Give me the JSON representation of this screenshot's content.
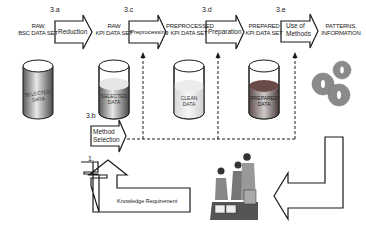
{
  "diagram": {
    "stages": [
      {
        "id": "raw-bsc",
        "label_line1": "RAW",
        "label_line2": "BSC DATA SET",
        "cylinder_text_line1": "SELECTED",
        "cylinder_text_line2": "DATA",
        "fill": "full-gray"
      },
      {
        "id": "raw-kpi",
        "label_line1": "RAW",
        "label_line2": "KPI DATA SET",
        "cylinder_text_line1": "SELECTED",
        "cylinder_text_line2": "DATA",
        "fill": "partial-gray"
      },
      {
        "id": "preprocessed-kpi",
        "label_line1": "PREPROCESSED",
        "label_line2": "KPI DATA SET",
        "cylinder_text_line1": "CLEAN",
        "cylinder_text_line2": "DATA",
        "fill": "light"
      },
      {
        "id": "prepared-kpi",
        "label_line1": "PREPARED",
        "label_line2": "KPI DATA SET",
        "cylinder_text_line1": "PREPARED",
        "cylinder_text_line2": "DATA",
        "fill": "dark-top"
      },
      {
        "id": "patterns",
        "label_line1": "PATTERNS,",
        "label_line2": "INFORMATION",
        "icon": "gears-icon"
      }
    ],
    "process_arrows": [
      {
        "step": "3.a",
        "label_line1": "Reduction",
        "label_line2": ""
      },
      {
        "step": "3.c",
        "label_line1": "Preprocessing",
        "label_line2": ""
      },
      {
        "step": "3.d",
        "label_line1": "Preparation",
        "label_line2": ""
      },
      {
        "step": "3.e",
        "label_line1": "Use of",
        "label_line2": "Methods"
      }
    ],
    "method_selection": {
      "step": "3.b",
      "label_line1": "Method",
      "label_line2": "Selection"
    },
    "knowledge": {
      "step": "1.",
      "label": "Knowledge Requirement"
    },
    "people_icon": "team-meeting-icon",
    "colors": {
      "line": "#1a1a1a",
      "cyl_gray": "#9a9a9a",
      "cyl_dark": "#6a4a48",
      "gear": "#8a8a8a"
    }
  }
}
